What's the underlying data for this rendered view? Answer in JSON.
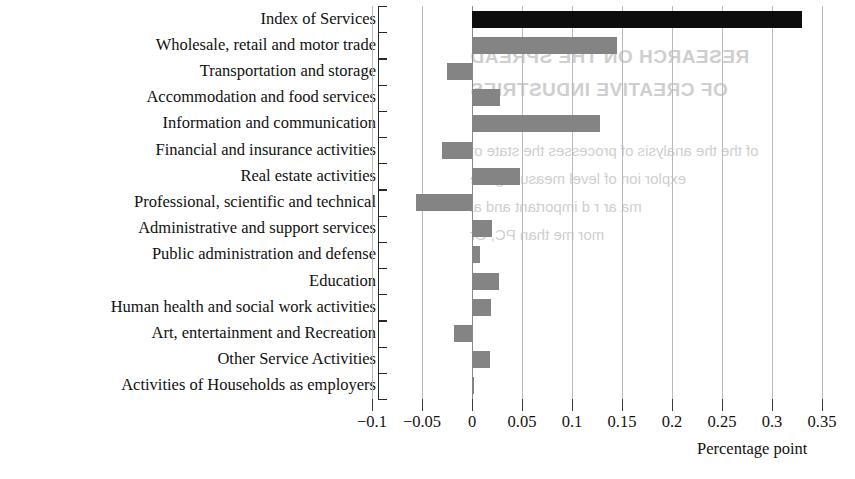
{
  "chart_data": {
    "type": "bar",
    "orientation": "horizontal",
    "title": "",
    "subtitle": "",
    "xlabel": "Percentage point",
    "ylabel": "",
    "xlim": [
      -0.115,
      0.36
    ],
    "grid": true,
    "legend": "none",
    "xticks": [
      "-0.1",
      "-0.05",
      "0",
      "0.05",
      "0.1",
      "0.15",
      "0.2",
      "0.25",
      "0.3",
      "0.35"
    ],
    "xtick_values": [
      -0.1,
      -0.05,
      0,
      0.05,
      0.1,
      0.15,
      0.2,
      0.25,
      0.3,
      0.35
    ],
    "categories": [
      "Index of Services",
      "Wholesale, retail and motor trade",
      "Transportation and storage",
      "Accommodation and food services",
      "Information and communication",
      "Financial and insurance activities",
      "Real estate activities",
      "Professional, scientific and technical",
      "Administrative and support services",
      "Public administration and defense",
      "Education",
      "Human health and social work activities",
      "Art, entertainment and Recreation",
      "Other Service Activities",
      "Activities of Households as employers"
    ],
    "values": [
      0.33,
      0.145,
      -0.025,
      0.028,
      0.128,
      -0.03,
      0.048,
      -0.056,
      0.02,
      0.008,
      0.027,
      0.019,
      -0.018,
      0.018,
      0.002
    ],
    "bar_colors": [
      "#0d0d0d",
      "#848484",
      "#848484",
      "#848484",
      "#848484",
      "#848484",
      "#848484",
      "#848484",
      "#848484",
      "#848484",
      "#848484",
      "#848484",
      "#848484",
      "#848484",
      "#848484"
    ],
    "highlight_color": "#0d0d0d",
    "series_color": "#848484"
  },
  "background_bleed": {
    "heading_line1": "RESEARCH ON THE SPREAD",
    "heading_line2": "OF CREATIVE INDUSTRIES",
    "body_line1": "of the the analysis of processes the state of",
    "body_line2": "explor ion of  level measuring the",
    "body_line3": "ma ar  r d important and al",
    "body_line4": "mor   me than     PC, Gr"
  }
}
